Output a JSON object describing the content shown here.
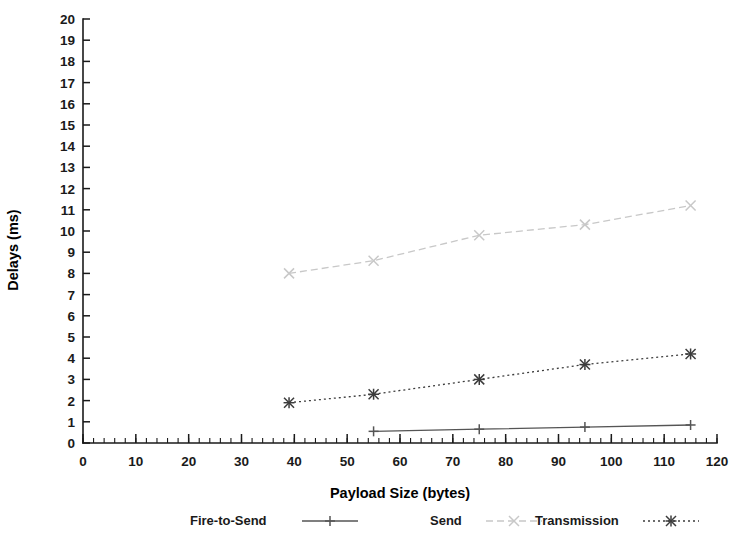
{
  "chart_data": {
    "type": "line",
    "title": "",
    "subtitle": "",
    "xlabel": "Payload Size (bytes)",
    "ylabel": "Delays (ms)",
    "xlim": [
      0,
      120
    ],
    "ylim": [
      0,
      20
    ],
    "xticks": [
      0,
      10,
      20,
      30,
      40,
      50,
      60,
      70,
      80,
      90,
      100,
      110,
      120
    ],
    "yticks": [
      0,
      1,
      2,
      3,
      4,
      5,
      6,
      7,
      8,
      9,
      10,
      11,
      12,
      13,
      14,
      15,
      16,
      17,
      18,
      19,
      20
    ],
    "xtick_labels": [
      "0",
      "10",
      "20",
      "30",
      "40",
      "50",
      "60",
      "70",
      "80",
      "90",
      "100",
      "110",
      "120"
    ],
    "ytick_labels": [
      "0",
      "1",
      "2",
      "3",
      "4",
      "5",
      "6",
      "7",
      "8",
      "9",
      "10",
      "11",
      "12",
      "13",
      "14",
      "15",
      "16",
      "17",
      "18",
      "19",
      "20"
    ],
    "x_minor_tick_step": 2,
    "grid": false,
    "legend_position": "below-axes",
    "frame": "left-and-bottom-only",
    "series": [
      {
        "name": "Fire-to-Send",
        "color": "#555555",
        "linestyle": "solid",
        "marker": "plus",
        "points": [
          {
            "x": 55,
            "y": 0.55
          },
          {
            "x": 75,
            "y": 0.65
          },
          {
            "x": 95,
            "y": 0.75
          },
          {
            "x": 115,
            "y": 0.85
          }
        ]
      },
      {
        "name": "Send",
        "color": "#c8c8c8",
        "linestyle": "dashed",
        "marker": "cross",
        "points": [
          {
            "x": 39,
            "y": 8.0
          },
          {
            "x": 55,
            "y": 8.6
          },
          {
            "x": 75,
            "y": 9.8
          },
          {
            "x": 95,
            "y": 10.3
          },
          {
            "x": 115,
            "y": 11.2
          }
        ]
      },
      {
        "name": "Transmission",
        "color": "#3c3c3c",
        "linestyle": "dotted",
        "marker": "asterisk",
        "points": [
          {
            "x": 39,
            "y": 1.9
          },
          {
            "x": 55,
            "y": 2.3
          },
          {
            "x": 75,
            "y": 3.0
          },
          {
            "x": 95,
            "y": 3.7
          },
          {
            "x": 115,
            "y": 4.2
          }
        ]
      }
    ],
    "legend_entries": [
      {
        "label": "Fire-to-Send",
        "marker": "plus",
        "linestyle": "solid",
        "color": "#555555"
      },
      {
        "label": "Send",
        "marker": "cross",
        "linestyle": "dashed",
        "color": "#c8c8c8"
      },
      {
        "label": "Transmission",
        "marker": "asterisk",
        "linestyle": "dotted",
        "color": "#3c3c3c"
      }
    ]
  }
}
